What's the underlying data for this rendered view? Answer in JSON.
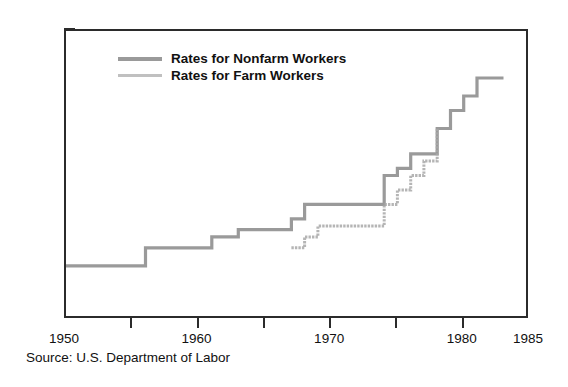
{
  "source_note": "Source: U.S. Department of Labor",
  "legend": {
    "position": "inside-top-left",
    "items": [
      {
        "label": "Rates for Nonfarm Workers",
        "key": "nonfarm",
        "color": "#9a9a9a"
      },
      {
        "label": "Rates for Farm Workers",
        "key": "farm",
        "color": "#a8a8a8"
      }
    ]
  },
  "axes": {
    "y_ticks": [
      "0",
      "$1.00",
      "$2.00",
      "$3.00",
      "$4.00"
    ],
    "x_ticks": [
      "1950",
      "1955",
      "1960",
      "1965",
      "1970",
      "1975",
      "1980",
      "1985"
    ],
    "x_tick_labels_shown": [
      "1950",
      "1960",
      "1970",
      "1980",
      "1985"
    ]
  },
  "chart_data": {
    "type": "line",
    "title": "",
    "subtitle": "",
    "xlabel": "",
    "ylabel": "",
    "xlim": [
      1950,
      1985
    ],
    "ylim": [
      0,
      4.0
    ],
    "grid": false,
    "step": "post",
    "legend_position": "inside-top-left",
    "y_tick_values": [
      0,
      1.0,
      2.0,
      3.0,
      4.0
    ],
    "y_tick_labels": [
      "0",
      "$1.00",
      "$2.00",
      "$3.00",
      "$4.00"
    ],
    "x_tick_values": [
      1950,
      1955,
      1960,
      1965,
      1970,
      1975,
      1980,
      1985
    ],
    "x_tick_labels": [
      "1950",
      "",
      "1960",
      "",
      "1970",
      "",
      "1980",
      "1985"
    ],
    "annotations": [
      "Source: U.S. Department of Labor"
    ],
    "series": [
      {
        "name": "Rates for Nonfarm Workers",
        "color": "#9a9a9a",
        "style": "solid",
        "x": [
          1950,
          1956,
          1961,
          1963,
          1967,
          1968,
          1974,
          1975,
          1976,
          1978,
          1979,
          1980,
          1981,
          1983
        ],
        "values": [
          0.75,
          1.0,
          1.15,
          1.25,
          1.4,
          1.6,
          2.0,
          2.1,
          2.3,
          2.65,
          2.9,
          3.1,
          3.35,
          3.35
        ]
      },
      {
        "name": "Rates for Farm Workers",
        "color": "#a8a8a8",
        "style": "dotted",
        "x": [
          1967,
          1968,
          1969,
          1974,
          1975,
          1976,
          1977,
          1978
        ],
        "values": [
          1.0,
          1.15,
          1.3,
          1.6,
          1.8,
          2.0,
          2.2,
          2.65
        ]
      }
    ]
  }
}
